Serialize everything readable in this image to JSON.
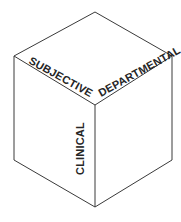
{
  "diagram": {
    "background_color": "#ffffff",
    "edge_color": "#3a3a3a",
    "face_color": "#ffffff",
    "label_color": "#262626",
    "faces": [
      {
        "id": "top-left-face",
        "label": "SUBJECTIVE",
        "rotation_degrees": 29,
        "label_x": 28,
        "label_y": 63
      },
      {
        "id": "top-right-face",
        "label": "DEPARTMENTAL",
        "rotation_degrees": -29,
        "label_x": 101,
        "label_y": 97
      },
      {
        "id": "front-left-face",
        "label": "CLINICAL",
        "rotation_degrees": -90,
        "label_x": 84,
        "label_y": 175
      }
    ],
    "vertices": {
      "top": "95,12",
      "left": "14,56",
      "right": "172,56",
      "center": "95,105",
      "bottom_left": "14,160",
      "bottom_right": "172,160",
      "bottom": "95,207"
    },
    "outlines": {
      "top_face": "95,12 14,56 95,105 172,56",
      "front_left_face": "14,56 14,160 95,207 95,105",
      "front_right_face": "172,56 172,160 95,207 95,105",
      "silhouette": "95,12 14,56 14,160 95,207 172,160 172,56 95,12",
      "center_ridge_left": "14,56 95,105",
      "center_ridge_right": "172,56 95,105",
      "center_vertical": "95,105 95,207"
    }
  }
}
